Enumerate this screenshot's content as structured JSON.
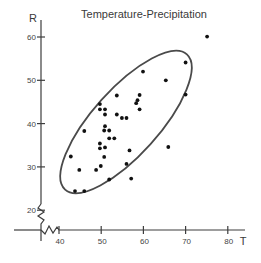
{
  "chart_data": {
    "type": "scatter",
    "title": "Temperature-Precipitation",
    "xlabel": "T",
    "ylabel": "R",
    "x_ticks": [
      40,
      50,
      60,
      70,
      80
    ],
    "y_ticks": [
      20,
      30,
      40,
      50,
      60
    ],
    "xlim": [
      36,
      82
    ],
    "ylim": [
      17,
      62
    ],
    "grid": false,
    "legend": null,
    "axis_breaks": {
      "x": true,
      "y": true
    },
    "annotations": [
      "ellipse enclosing most data points (concentration ellipse)"
    ],
    "series": [
      {
        "name": "observations",
        "points": [
          [
            75.1,
            60.1
          ],
          [
            70.0,
            54.1
          ],
          [
            65.3,
            50.0
          ],
          [
            59.9,
            52.0
          ],
          [
            59.1,
            46.6
          ],
          [
            58.6,
            45.4
          ],
          [
            58.3,
            44.7
          ],
          [
            70.0,
            46.7
          ],
          [
            59.1,
            43.3
          ],
          [
            53.7,
            46.5
          ],
          [
            49.7,
            44.5
          ],
          [
            49.7,
            43.3
          ],
          [
            50.9,
            43.3
          ],
          [
            53.7,
            42.1
          ],
          [
            50.9,
            42.1
          ],
          [
            54.9,
            41.3
          ],
          [
            56.0,
            41.3
          ],
          [
            50.9,
            39.4
          ],
          [
            46.0,
            38.3
          ],
          [
            50.7,
            38.4
          ],
          [
            51.9,
            38.4
          ],
          [
            51.9,
            36.6
          ],
          [
            53.1,
            36.6
          ],
          [
            49.7,
            35.4
          ],
          [
            49.7,
            34.3
          ],
          [
            50.9,
            34.5
          ],
          [
            56.7,
            33.8
          ],
          [
            65.9,
            34.6
          ],
          [
            50.7,
            32.3
          ],
          [
            42.8,
            32.4
          ],
          [
            49.9,
            30.2
          ],
          [
            48.8,
            29.3
          ],
          [
            44.8,
            29.3
          ],
          [
            56.0,
            30.7
          ],
          [
            51.9,
            27.1
          ],
          [
            57.1,
            27.3
          ],
          [
            43.8,
            24.4
          ],
          [
            46.0,
            24.4
          ]
        ]
      }
    ]
  }
}
